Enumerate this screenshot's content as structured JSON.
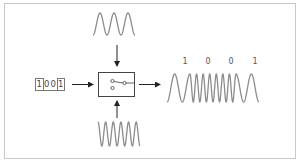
{
  "diagram": {
    "type": "FSK modulation",
    "input_bits": [
      "1",
      "0",
      "0",
      "1"
    ],
    "output_labels": [
      "1",
      "0",
      "0",
      "1"
    ],
    "components": {
      "input": "binary data 1001",
      "carrier_low": "low-frequency sine carrier (top)",
      "carrier_high": "high-frequency sine carrier (bottom)",
      "switch": "selector switch",
      "output": "frequency-shift keyed waveform"
    },
    "colors": {
      "frame": "#c8c8c8",
      "wave": "#8c8c8c",
      "arrow": "#222222",
      "box": "#555555"
    }
  }
}
